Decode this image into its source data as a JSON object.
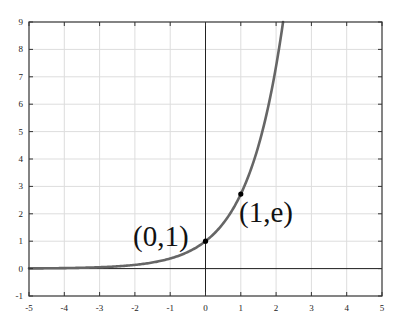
{
  "chart_data": {
    "type": "line",
    "title": "",
    "function": "y = e^x",
    "xlabel": "",
    "ylabel": "",
    "xlim": [
      -5,
      5
    ],
    "ylim": [
      -1,
      9
    ],
    "x_ticks": [
      -5,
      -4,
      -3,
      -2,
      -1,
      0,
      1,
      2,
      3,
      4,
      5
    ],
    "y_ticks": [
      -1,
      0,
      1,
      2,
      3,
      4,
      5,
      6,
      7,
      8,
      9
    ],
    "grid": true,
    "legend": null,
    "series": [
      {
        "name": "exp(x)",
        "x": [
          -5,
          -4,
          -3,
          -2,
          -1,
          0,
          0.5,
          1,
          1.5,
          2,
          2.197
        ],
        "values": [
          0.0067,
          0.0183,
          0.0498,
          0.1353,
          0.3679,
          1,
          1.6487,
          2.7183,
          4.4817,
          7.3891,
          9
        ],
        "color": "#666666"
      }
    ],
    "points": [
      {
        "x": 0,
        "y": 1,
        "label": "(0,1)"
      },
      {
        "x": 1,
        "y": 2.7183,
        "label": "(1,e)"
      }
    ],
    "annotations": [
      "(0,1)",
      "(1,e)"
    ]
  },
  "colors": {
    "curve": "#666666",
    "grid": "#dddddd",
    "frame": "#333333",
    "axis": "#222222",
    "point": "#000000"
  }
}
